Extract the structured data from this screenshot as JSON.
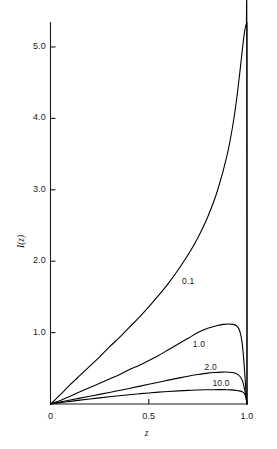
{
  "chart_data": {
    "type": "line",
    "title": "",
    "xlabel": "z",
    "ylabel": "I(z)",
    "xlim": [
      0,
      1.0
    ],
    "ylim": [
      0,
      5.35
    ],
    "grid": false,
    "legend_position": "inline-curve-labels",
    "xticks": [
      {
        "value": 0.0,
        "label": "0"
      },
      {
        "value": 0.5,
        "label": "0.5"
      },
      {
        "value": 1.0,
        "label": "1.0"
      }
    ],
    "yticks": [
      {
        "value": 1.0,
        "label": "1.0"
      },
      {
        "value": 2.0,
        "label": "2.0"
      },
      {
        "value": 3.0,
        "label": "3.0"
      },
      {
        "value": 4.0,
        "label": "4.0"
      },
      {
        "value": 5.0,
        "label": "5.0"
      }
    ],
    "series": [
      {
        "name": "0.1",
        "label": "0.1",
        "label_x": 0.72,
        "label_y": 1.72,
        "color": "#000000",
        "x": [
          0.0,
          0.02,
          0.05,
          0.1,
          0.15,
          0.2,
          0.25,
          0.3,
          0.35,
          0.4,
          0.45,
          0.5,
          0.55,
          0.6,
          0.65,
          0.7,
          0.75,
          0.8,
          0.85,
          0.9,
          0.93,
          0.95,
          0.965,
          0.975,
          0.982,
          0.988,
          0.992,
          0.995,
          0.997,
          0.999,
          1.0
        ],
        "y": [
          0.0,
          0.05,
          0.13,
          0.27,
          0.4,
          0.53,
          0.66,
          0.8,
          0.93,
          1.07,
          1.21,
          1.36,
          1.52,
          1.69,
          1.88,
          2.09,
          2.33,
          2.62,
          2.99,
          3.5,
          3.94,
          4.33,
          4.68,
          4.93,
          5.1,
          5.22,
          5.28,
          5.31,
          5.32,
          5.33,
          0.0
        ]
      },
      {
        "name": "1.0",
        "label": "1.0",
        "label_x": 0.775,
        "label_y": 0.845,
        "color": "#000000",
        "x": [
          0.0,
          0.02,
          0.05,
          0.1,
          0.15,
          0.2,
          0.25,
          0.3,
          0.35,
          0.4,
          0.45,
          0.5,
          0.55,
          0.6,
          0.65,
          0.7,
          0.75,
          0.8,
          0.85,
          0.88,
          0.91,
          0.93,
          0.945,
          0.955,
          0.962,
          0.968,
          0.974,
          0.98,
          0.986,
          0.991,
          0.995,
          0.998,
          1.0
        ],
        "y": [
          0.0,
          0.02,
          0.05,
          0.11,
          0.17,
          0.23,
          0.29,
          0.35,
          0.41,
          0.48,
          0.54,
          0.61,
          0.68,
          0.76,
          0.84,
          0.92,
          1.0,
          1.06,
          1.1,
          1.115,
          1.12,
          1.115,
          1.1,
          1.07,
          1.03,
          0.97,
          0.88,
          0.73,
          0.53,
          0.33,
          0.17,
          0.06,
          0.0
        ]
      },
      {
        "name": "2.0",
        "label": "2.0",
        "label_x": 0.835,
        "label_y": 0.525,
        "color": "#000000",
        "x": [
          0.0,
          0.02,
          0.05,
          0.1,
          0.15,
          0.2,
          0.25,
          0.3,
          0.35,
          0.4,
          0.45,
          0.5,
          0.55,
          0.6,
          0.65,
          0.7,
          0.75,
          0.8,
          0.84,
          0.87,
          0.89,
          0.91,
          0.925,
          0.94,
          0.952,
          0.962,
          0.972,
          0.98,
          0.988,
          0.994,
          0.998,
          1.0
        ],
        "y": [
          0.0,
          0.012,
          0.028,
          0.055,
          0.082,
          0.108,
          0.135,
          0.162,
          0.19,
          0.218,
          0.247,
          0.276,
          0.305,
          0.334,
          0.362,
          0.389,
          0.412,
          0.432,
          0.442,
          0.447,
          0.448,
          0.445,
          0.44,
          0.43,
          0.415,
          0.392,
          0.352,
          0.295,
          0.2,
          0.11,
          0.035,
          0.0
        ]
      },
      {
        "name": "10.0",
        "label": "10.0",
        "label_x": 0.875,
        "label_y": 0.3,
        "color": "#000000",
        "x": [
          0.0,
          0.02,
          0.05,
          0.1,
          0.15,
          0.2,
          0.25,
          0.3,
          0.35,
          0.4,
          0.45,
          0.5,
          0.55,
          0.6,
          0.65,
          0.7,
          0.75,
          0.79,
          0.82,
          0.85,
          0.875,
          0.895,
          0.915,
          0.932,
          0.948,
          0.96,
          0.97,
          0.979,
          0.986,
          0.992,
          0.996,
          0.999,
          1.0
        ],
        "y": [
          0.0,
          0.008,
          0.019,
          0.037,
          0.054,
          0.07,
          0.086,
          0.101,
          0.116,
          0.13,
          0.143,
          0.155,
          0.166,
          0.176,
          0.184,
          0.191,
          0.196,
          0.199,
          0.2,
          0.201,
          0.201,
          0.2,
          0.198,
          0.195,
          0.19,
          0.184,
          0.177,
          0.166,
          0.15,
          0.12,
          0.08,
          0.03,
          0.0
        ]
      }
    ],
    "frame": {
      "axis_color": "#1a1a1a",
      "curve_color": "#000000",
      "right_boundary_line": true,
      "right_boundary_note": "vertical line at z = 1.0"
    }
  }
}
